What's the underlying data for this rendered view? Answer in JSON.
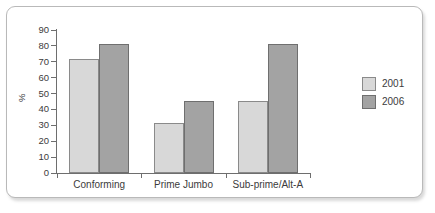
{
  "chart_data": {
    "type": "bar",
    "title": "",
    "subtitle": "",
    "xlabel": "",
    "ylabel": "%",
    "ylim": [
      0,
      90
    ],
    "ytick_step": 10,
    "yticks": [
      90,
      80,
      70,
      60,
      50,
      40,
      30,
      20,
      10,
      0
    ],
    "grid": false,
    "legend_position": "right",
    "categories": [
      "Conforming",
      "Prime Jumbo",
      "Sub-prime/Alt-A"
    ],
    "series": [
      {
        "name": "2001",
        "color": "#d8d8d8",
        "values": [
          72,
          31.5,
          45.5
        ]
      },
      {
        "name": "2006",
        "color": "#a3a3a3",
        "values": [
          81,
          45.5,
          81
        ]
      }
    ]
  },
  "colors": {
    "series_2001": "#d8d8d8",
    "series_2006": "#a3a3a3",
    "bar_outline": "#8a8a8a",
    "axis": "#6e6e6e",
    "text": "#3b3b3b",
    "frame_border": "#b9b9b9",
    "background": "#ffffff"
  }
}
